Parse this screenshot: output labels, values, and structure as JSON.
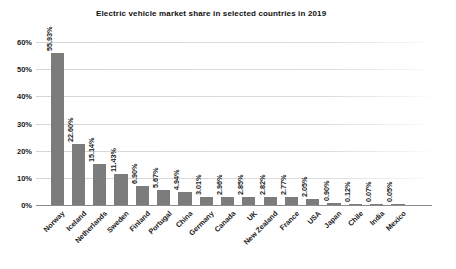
{
  "chart_data": {
    "type": "bar",
    "title": "Electric vehicle market share in selected countries in 2019",
    "xlabel": "",
    "ylabel": "",
    "ylim": [
      0,
      60
    ],
    "ytick_labels": [
      "60%",
      "50%",
      "40%",
      "30%",
      "20%",
      "10%",
      "0%"
    ],
    "ytick_values": [
      60,
      50,
      40,
      30,
      20,
      10,
      0
    ],
    "grid": "horizontal",
    "legend": "none",
    "bar_color": "#7c7c7c",
    "categories": [
      "Norway",
      "Iceland",
      "Netherlands",
      "Sweden",
      "Finland",
      "Portugal",
      "China",
      "Germany",
      "Canada",
      "UK",
      "New Zealand",
      "France",
      "USA",
      "Japan",
      "Chile",
      "India",
      "Mexico"
    ],
    "values": [
      55.93,
      22.6,
      15.14,
      11.43,
      6.9,
      5.67,
      4.94,
      3.01,
      2.96,
      2.85,
      2.82,
      2.77,
      2.05,
      0.9,
      0.12,
      0.07,
      0.05
    ],
    "value_labels": [
      "55.93%",
      "22.60%",
      "15.14%",
      "11.43%",
      "6.90%",
      "5.67%",
      "4.94%",
      "3.01%",
      "2.96%",
      "2.85%",
      "2.82%",
      "2.77%",
      "2.05%",
      "0.90%",
      "0.12%",
      "0.07%",
      "0.05%"
    ]
  }
}
